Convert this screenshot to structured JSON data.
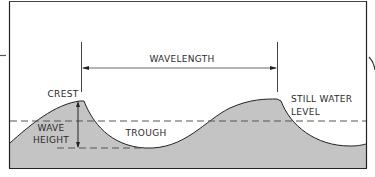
{
  "diagram": {
    "type": "wave-anatomy",
    "labels": {
      "wavelength": "WAVELENGTH",
      "crest": "CREST",
      "wave_height_line1": "WAVE",
      "wave_height_line2": "HEIGHT",
      "trough": "TROUGH",
      "still_water_line1": "STILL WATER",
      "still_water_line2": "LEVEL"
    },
    "colors": {
      "water_fill": "#c4c4c4",
      "outline": "#222222",
      "dashed_line": "#555555",
      "background": "#ffffff"
    }
  }
}
